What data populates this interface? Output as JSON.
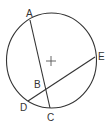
{
  "diagram": {
    "type": "circle-chords",
    "colors": {
      "stroke": "#333333",
      "background": "#ffffff",
      "text": "#333333"
    },
    "circle": {
      "cx": 51.5,
      "cy": 60.5,
      "rx": 45,
      "ry": 47.5
    },
    "center_mark": {
      "x": 51,
      "y": 61,
      "arm": 5,
      "icon": "plus-center-icon"
    },
    "points": {
      "A": {
        "label": "A",
        "x": 30,
        "y": 20,
        "lx": 26,
        "ly": 17
      },
      "B": {
        "label": "B",
        "x": 45,
        "y": 89,
        "lx": 34,
        "ly": 88
      },
      "C": {
        "label": "C",
        "x": 50,
        "y": 108,
        "lx": 47,
        "ly": 121
      },
      "D": {
        "label": "D",
        "x": 28,
        "y": 101,
        "lx": 20,
        "ly": 111
      },
      "E": {
        "label": "E",
        "x": 95,
        "y": 57,
        "lx": 98,
        "ly": 60
      }
    },
    "chords": [
      {
        "name": "AC",
        "from": "A",
        "to": "C"
      },
      {
        "name": "DE",
        "from": "D",
        "to": "E"
      }
    ]
  }
}
